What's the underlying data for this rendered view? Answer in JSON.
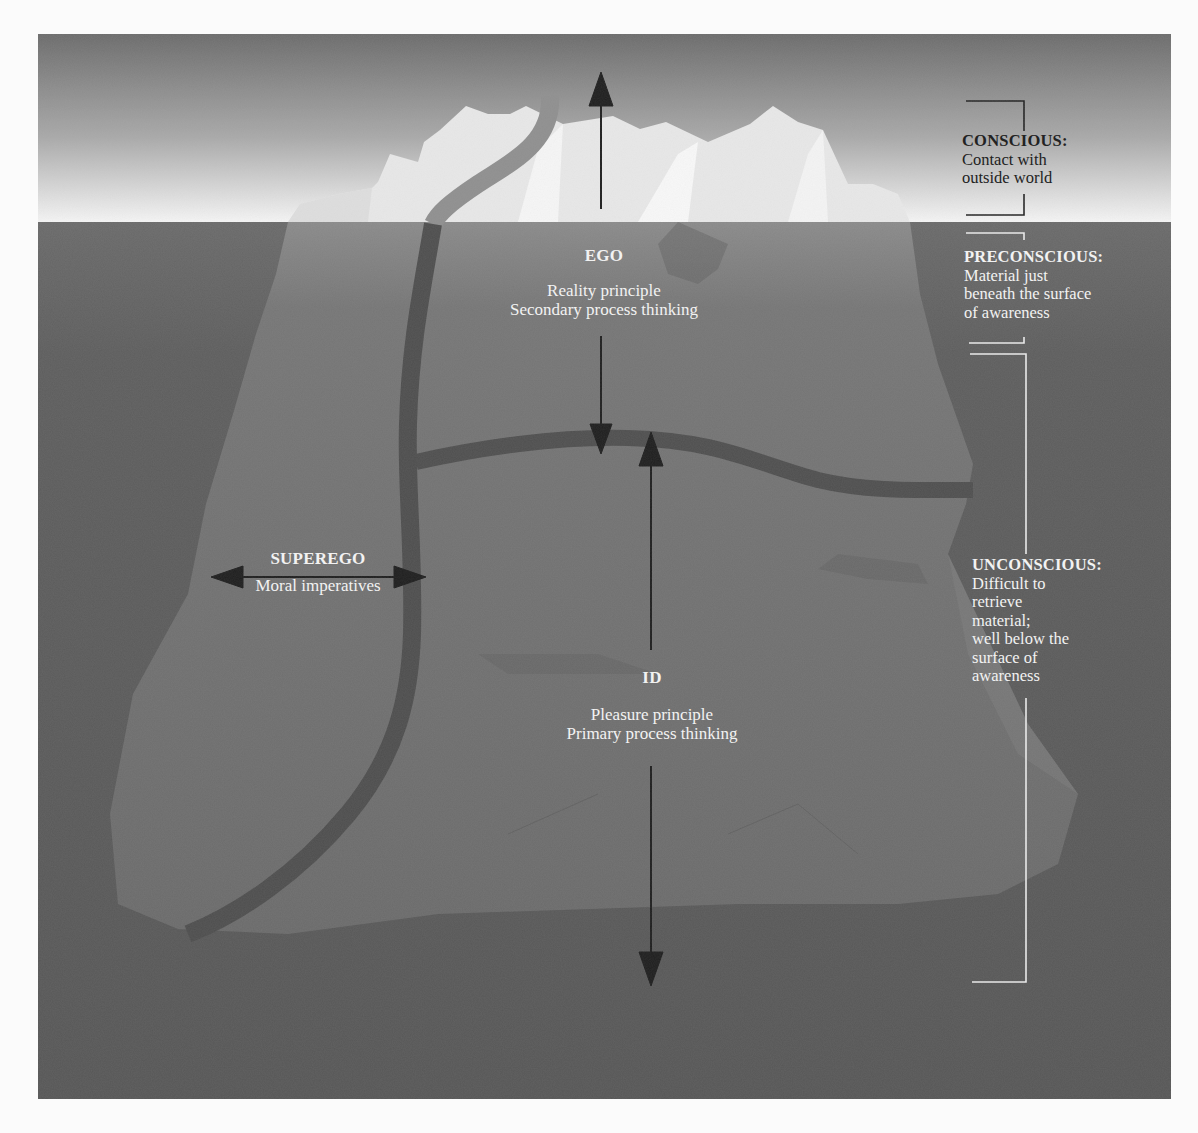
{
  "diagram": {
    "colors": {
      "sky_top": "#6e6e6e",
      "sky_bottom": "#f4f4f4",
      "water": "#5a5a5a",
      "ice_above": "#e9e9e9",
      "ice_below": "#6f6f6f",
      "boundary_band": "#4f4f4f",
      "arrow": "#1e1e1e",
      "label_light": "#f2f2f2",
      "label_dark": "#222222"
    },
    "structures": {
      "ego": {
        "title": "EGO",
        "lines": [
          "Reality principle",
          "Secondary process thinking"
        ]
      },
      "superego": {
        "title": "SUPEREGO",
        "lines": [
          "Moral imperatives"
        ]
      },
      "id": {
        "title": "ID",
        "lines": [
          "Pleasure principle",
          "Primary process thinking"
        ]
      }
    },
    "levels": {
      "conscious": {
        "title": "CONSCIOUS:",
        "lines": [
          "Contact with",
          "outside world"
        ]
      },
      "preconscious": {
        "title": "PRECONSCIOUS:",
        "lines": [
          "Material just",
          "beneath the surface",
          "of awareness"
        ]
      },
      "unconscious": {
        "title": "UNCONSCIOUS:",
        "lines": [
          "Difficult to",
          "retrieve",
          "material;",
          "well below the",
          "surface of",
          "awareness"
        ]
      }
    }
  }
}
